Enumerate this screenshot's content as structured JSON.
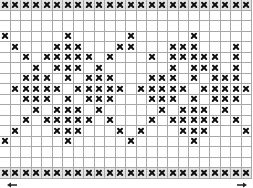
{
  "chart": {
    "columns": 24,
    "rows_count": 17,
    "symbol": "cross-stitch-x",
    "symbol_color": "#111111",
    "grid_line_color": "#a8a8a8",
    "band_rows": [
      0,
      16
    ],
    "rows": [
      "XXXXXXXXXXXXXXXXXXXXXXXX",
      "........................",
      "........................",
      "X.....X.....X.....X.....",
      ".X...XXX...XX...XXX...X.",
      "..X.XXXXX.X...X.XXXXX.X.",
      "...X.XXX.X......X.XXX.X.",
      "..XXX.X.XXX...XXX.X.XXX.",
      ".XXXXX.XXXXX.XXXXX.XXXXX",
      "..XXX.X.XXX...XXX.X.XXX.",
      "...X.XXX.X.....X.XXX.X..",
      "..X.XXXXX.X...X.XXXXX.X.",
      ".X...XXX...X.X...XXX...X",
      "X.....X.....X.....X.....",
      "........................",
      "........................",
      "XXXXXXXXXXXXXXXXXXXXXXXX"
    ]
  },
  "navigation": {
    "left_arrow_icon": "arrow-left-icon",
    "right_arrow_icon": "arrow-right-icon"
  }
}
